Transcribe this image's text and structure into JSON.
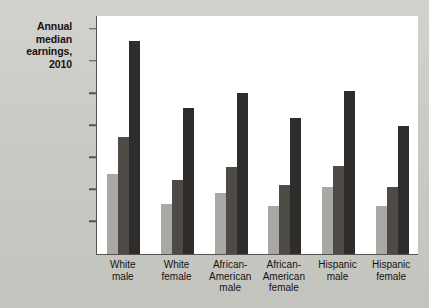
{
  "title": {
    "line1": "Annual",
    "line2": "median",
    "line3": "earnings,",
    "line4": "2010"
  },
  "legend": {
    "items": [
      {
        "label": "No HS degree",
        "color": "#a8a8a4"
      },
      {
        "label": "HS degree",
        "color": "#4e4b47"
      },
      {
        "label": "College degree",
        "color": "#2f2d2b"
      }
    ]
  },
  "axis": {
    "yticks": [
      "$70,000",
      "60,000",
      "50,000",
      "40,000",
      "30,000",
      "20,000",
      "10,000",
      "0"
    ]
  },
  "chart_data": {
    "type": "bar",
    "title": "Annual median earnings, 2010",
    "xlabel": "",
    "ylabel": "Annual median earnings, 2010",
    "ylim": [
      0,
      74000
    ],
    "ytick_values": [
      70000,
      60000,
      50000,
      40000,
      30000,
      20000,
      10000,
      0
    ],
    "grid": false,
    "legend_position": "top-right",
    "categories": [
      "White male",
      "White female",
      "African-American male",
      "African-American female",
      "Hispanic male",
      "Hispanic female"
    ],
    "category_lines": [
      [
        "White",
        "male"
      ],
      [
        "White",
        "female"
      ],
      [
        "African-",
        "American",
        "male"
      ],
      [
        "African-",
        "American",
        "female"
      ],
      [
        "Hispanic",
        "male"
      ],
      [
        "Hispanic",
        "female"
      ]
    ],
    "series": [
      {
        "name": "No HS degree",
        "color": "#a8a8a4",
        "values": [
          25000,
          15500,
          19000,
          15000,
          20800,
          15000
        ]
      },
      {
        "name": "HS degree",
        "color": "#4e4b47",
        "values": [
          36500,
          23000,
          27000,
          21500,
          27300,
          21000
        ]
      },
      {
        "name": "College degree",
        "color": "#2f2d2b",
        "values": [
          66500,
          45500,
          50200,
          42300,
          50800,
          40000
        ]
      }
    ]
  }
}
